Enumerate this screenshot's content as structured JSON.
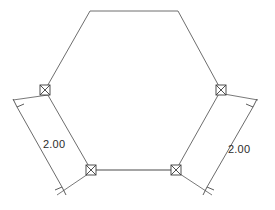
{
  "drawing": {
    "title": "Hexagon with dimensioned lower side edges",
    "canvas": {
      "width": 275,
      "height": 210
    },
    "background_color": "#ffffff",
    "line_color": "#6e6e6e",
    "text_color": "#2b2b2b"
  },
  "shape": {
    "name": "hexagon",
    "vertices": [
      {
        "id": "top-left",
        "x": 90,
        "y": 11
      },
      {
        "id": "top-right",
        "x": 178,
        "y": 11
      },
      {
        "id": "right",
        "x": 221,
        "y": 90
      },
      {
        "id": "bottom-right",
        "x": 176,
        "y": 170
      },
      {
        "id": "bottom-left",
        "x": 91,
        "y": 170
      },
      {
        "id": "left",
        "x": 45,
        "y": 90
      }
    ]
  },
  "nodes": [
    {
      "id": "node-left",
      "symbol": "square-x",
      "x": 45,
      "y": 90
    },
    {
      "id": "node-right",
      "symbol": "square-x",
      "x": 221,
      "y": 90
    },
    {
      "id": "node-bottom-left",
      "symbol": "square-x",
      "x": 91,
      "y": 170
    },
    {
      "id": "node-bottom-right",
      "symbol": "square-x",
      "x": 176,
      "y": 170
    }
  ],
  "dimensions": [
    {
      "id": "dim-left",
      "label": "2.00",
      "measures": "left lower edge",
      "label_x": 43,
      "label_y": 148,
      "line": {
        "x1": 17,
        "y1": 107,
        "x2": 62,
        "y2": 187
      },
      "ext_from": {
        "x": 45,
        "y": 90
      },
      "ext_to": {
        "x": 91,
        "y": 170
      }
    },
    {
      "id": "dim-right",
      "label": "2.00",
      "measures": "right lower edge",
      "label_x": 228,
      "label_y": 153,
      "line": {
        "x1": 253,
        "y1": 107,
        "x2": 207,
        "y2": 187
      },
      "ext_from": {
        "x": 221,
        "y": 90
      },
      "ext_to": {
        "x": 176,
        "y": 170
      }
    }
  ]
}
